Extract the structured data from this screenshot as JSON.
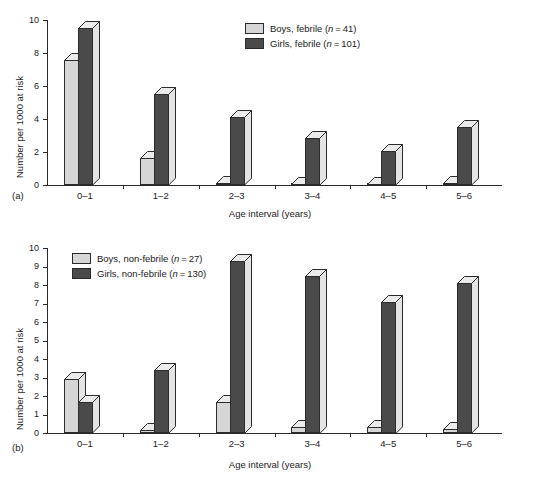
{
  "figure": {
    "y_axis_title": "Number per 1000 at risk",
    "x_axis_title": "Age interval (years)",
    "panel_a_label": "(a)",
    "panel_b_label": "(b)"
  },
  "chart_data": [
    {
      "type": "bar",
      "title": "",
      "panel": "(a)",
      "xlabel": "Age interval (years)",
      "ylabel": "Number per 1000 at risk",
      "ylim": [
        0,
        10
      ],
      "yticks": [
        0,
        2,
        4,
        6,
        8,
        10
      ],
      "grid": false,
      "legend_position": "top-right",
      "categories": [
        "0–1",
        "1–2",
        "2–3",
        "3–4",
        "4–5",
        "5–6"
      ],
      "series": [
        {
          "name": "Boys, febrile (n = 41)",
          "color": "#d6d6d6",
          "values": [
            7.6,
            1.65,
            0.15,
            0.05,
            0.05,
            0.1
          ]
        },
        {
          "name": "Girls, febrile (n = 101)",
          "color": "#4a4a4a",
          "values": [
            9.5,
            5.5,
            4.1,
            2.85,
            2.05,
            3.5
          ]
        }
      ]
    },
    {
      "type": "bar",
      "title": "",
      "panel": "(b)",
      "xlabel": "Age interval (years)",
      "ylabel": "Number per 1000 at risk",
      "ylim": [
        0,
        10
      ],
      "yticks": [
        0,
        1,
        2,
        3,
        4,
        5,
        6,
        7,
        8,
        9,
        10
      ],
      "grid": false,
      "legend_position": "top-left",
      "categories": [
        "0–1",
        "1–2",
        "2–3",
        "3–4",
        "4–5",
        "5–6"
      ],
      "series": [
        {
          "name": "Boys, non-febrile (n = 27)",
          "color": "#d6d6d6",
          "values": [
            2.9,
            0.15,
            1.7,
            0.3,
            0.3,
            0.2
          ]
        },
        {
          "name": "Girls, non-febrile (n = 130)",
          "color": "#4a4a4a",
          "values": [
            1.65,
            3.4,
            9.3,
            8.5,
            7.1,
            8.1
          ]
        }
      ]
    }
  ],
  "legend_a": {
    "rows": [
      {
        "label_plain": "Boys, febrile (",
        "label_italic": "n",
        "label_tail": " = 41)",
        "swatch": "light"
      },
      {
        "label_plain": "Girls, febrile (",
        "label_italic": "n",
        "label_tail": " = 101)",
        "swatch": "dark"
      }
    ]
  },
  "legend_b": {
    "rows": [
      {
        "label_plain": "Boys, non-febrile (",
        "label_italic": "n",
        "label_tail": " = 27)",
        "swatch": "light"
      },
      {
        "label_plain": "Girls, non-febrile (",
        "label_italic": "n",
        "label_tail": " = 130)",
        "swatch": "dark"
      }
    ]
  }
}
